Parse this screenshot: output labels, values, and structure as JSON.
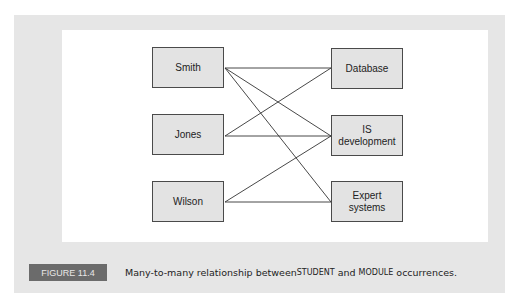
{
  "figure": {
    "label": "FIGURE 11.4",
    "caption_parts": {
      "pre": "Many-to-many relationship between ",
      "entity1": "STUDENT",
      "mid": " and ",
      "entity2": "MODULE",
      "post": " occurrences."
    }
  },
  "diagram": {
    "students": [
      {
        "id": "smith",
        "label": "Smith"
      },
      {
        "id": "jones",
        "label": "Jones"
      },
      {
        "id": "wilson",
        "label": "Wilson"
      }
    ],
    "modules": [
      {
        "id": "database",
        "label": "Database"
      },
      {
        "id": "is_development",
        "label": "IS development"
      },
      {
        "id": "expert_systems",
        "label": "Expert systems"
      }
    ],
    "links": [
      [
        "Smith",
        "Database"
      ],
      [
        "Smith",
        "IS development"
      ],
      [
        "Smith",
        "Expert systems"
      ],
      [
        "Jones",
        "Database"
      ],
      [
        "Jones",
        "IS development"
      ],
      [
        "Wilson",
        "IS development"
      ],
      [
        "Wilson",
        "Expert systems"
      ]
    ]
  }
}
